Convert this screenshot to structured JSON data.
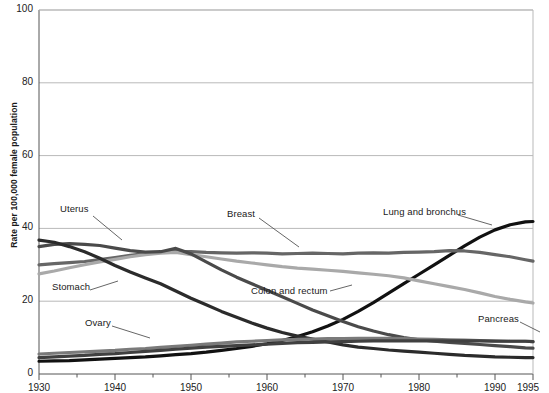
{
  "chart_data": {
    "type": "line",
    "title": "",
    "xlabel": "",
    "ylabel": "Rate per 100,000 female population",
    "xlim": [
      1930,
      1995
    ],
    "ylim": [
      0,
      100
    ],
    "grid": true,
    "legend_position": "inline-annotations",
    "x_ticks": [
      "1930",
      "1940",
      "1950",
      "1960",
      "1970",
      "1980",
      "1990",
      "1995"
    ],
    "x_tick_values": [
      1930,
      1940,
      1950,
      1960,
      1970,
      1980,
      1990,
      1995
    ],
    "x_minor_ticks": [
      1935,
      1945,
      1955,
      1965,
      1975,
      1985
    ],
    "y_ticks": [
      "0",
      "20",
      "40",
      "60",
      "80",
      "100"
    ],
    "y_tick_values": [
      0,
      20,
      40,
      60,
      80,
      100
    ],
    "x": [
      1930,
      1932,
      1934,
      1936,
      1938,
      1940,
      1942,
      1944,
      1946,
      1948,
      1950,
      1952,
      1954,
      1956,
      1958,
      1960,
      1962,
      1964,
      1966,
      1968,
      1970,
      1972,
      1974,
      1976,
      1978,
      1980,
      1982,
      1984,
      1986,
      1988,
      1990,
      1992,
      1994,
      1995
    ],
    "series": [
      {
        "name": "Lung and bronchus",
        "color": "#111111",
        "label_x": 383,
        "label_y": 213,
        "values": [
          3.5,
          3.6,
          3.7,
          3.9,
          4.1,
          4.3,
          4.5,
          4.7,
          5.0,
          5.3,
          5.6,
          6.0,
          6.5,
          7.0,
          7.6,
          8.3,
          9.2,
          10.3,
          11.6,
          13.2,
          15.0,
          17.2,
          19.6,
          22.2,
          24.8,
          27.4,
          30.0,
          32.6,
          35.2,
          37.6,
          39.6,
          41.0,
          41.8,
          41.9
        ]
      },
      {
        "name": "Breast",
        "color": "#666666",
        "label_x": 227,
        "label_y": 215,
        "values": [
          30.0,
          30.3,
          30.6,
          30.9,
          31.4,
          32.0,
          32.6,
          33.1,
          33.4,
          33.6,
          33.6,
          33.4,
          33.3,
          33.2,
          33.3,
          33.2,
          33.0,
          33.1,
          33.2,
          33.1,
          33.0,
          33.2,
          33.3,
          33.2,
          33.4,
          33.5,
          33.6,
          33.9,
          33.8,
          33.4,
          32.8,
          32.2,
          31.4,
          31.0
        ]
      },
      {
        "name": "Colon and rectum",
        "color": "#a9a9a9",
        "label_x": 251,
        "label_y": 292,
        "values": [
          27.5,
          28.3,
          29.2,
          30.0,
          30.8,
          31.5,
          32.2,
          32.8,
          33.2,
          33.4,
          32.8,
          32.2,
          31.6,
          31.0,
          30.5,
          30.0,
          29.5,
          29.1,
          28.8,
          28.5,
          28.2,
          27.8,
          27.4,
          27.0,
          26.4,
          25.6,
          24.8,
          24.0,
          23.2,
          22.3,
          21.3,
          20.5,
          19.8,
          19.5
        ]
      },
      {
        "name": "Uterus",
        "color": "#4a4a4a",
        "label_x": 60,
        "label_y": 210,
        "values": [
          35.0,
          35.6,
          35.8,
          35.6,
          35.3,
          34.6,
          33.9,
          33.5,
          33.6,
          34.5,
          33.0,
          30.8,
          28.6,
          26.6,
          24.8,
          23.0,
          21.2,
          19.4,
          17.6,
          16.0,
          14.4,
          13.0,
          11.8,
          10.8,
          10.0,
          9.4,
          9.0,
          8.7,
          8.4,
          8.1,
          7.8,
          7.5,
          7.2,
          7.1
        ]
      },
      {
        "name": "Stomach",
        "color": "#2b2b2b",
        "label_x": 52,
        "label_y": 288,
        "values": [
          36.8,
          36.2,
          35.0,
          33.6,
          31.8,
          29.8,
          28.0,
          26.4,
          24.8,
          22.8,
          20.8,
          19.0,
          17.2,
          15.6,
          14.0,
          12.6,
          11.4,
          10.4,
          9.6,
          8.8,
          8.0,
          7.4,
          7.0,
          6.6,
          6.3,
          6.0,
          5.7,
          5.4,
          5.1,
          4.9,
          4.7,
          4.6,
          4.5,
          4.5
        ]
      },
      {
        "name": "Ovary",
        "color": "#7a7a7a",
        "label_x": 85,
        "label_y": 324,
        "values": [
          5.5,
          5.7,
          5.9,
          6.1,
          6.3,
          6.5,
          6.8,
          7.0,
          7.3,
          7.6,
          7.9,
          8.2,
          8.5,
          8.8,
          9.0,
          9.2,
          9.4,
          9.5,
          9.6,
          9.7,
          9.7,
          9.8,
          9.8,
          9.8,
          9.7,
          9.6,
          9.5,
          9.4,
          9.3,
          9.2,
          9.1,
          9.0,
          9.0,
          8.9
        ]
      },
      {
        "name": "Pancreas",
        "color": "#404040",
        "label_x": 478,
        "label_y": 320,
        "values": [
          4.5,
          4.7,
          4.9,
          5.1,
          5.4,
          5.6,
          5.9,
          6.2,
          6.5,
          6.8,
          7.1,
          7.4,
          7.6,
          7.8,
          8.0,
          8.2,
          8.4,
          8.6,
          8.7,
          8.8,
          8.9,
          9.0,
          9.1,
          9.1,
          9.1,
          9.1,
          9.1,
          9.1,
          9.1,
          9.1,
          9.0,
          9.0,
          9.0,
          8.9
        ]
      }
    ],
    "annotations": [
      {
        "label": "Uterus",
        "leader_from": [
          93,
          216
        ],
        "leader_to": [
          122,
          240
        ]
      },
      {
        "label": "Stomach",
        "leader_from": [
          90,
          290
        ],
        "leader_to": [
          118,
          281
        ]
      },
      {
        "label": "Ovary",
        "leader_from": [
          112,
          326
        ],
        "leader_to": [
          150,
          338
        ]
      },
      {
        "label": "Breast",
        "leader_from": [
          259,
          218
        ],
        "leader_to": [
          299,
          247
        ]
      },
      {
        "label": "Colon and rectum",
        "leader_from": [
          330,
          291
        ],
        "leader_to": [
          352,
          285
        ]
      },
      {
        "label": "Lung and bronchus",
        "leader_from": [
          458,
          215
        ],
        "leader_to": [
          492,
          225
        ]
      },
      {
        "label": "Pancreas",
        "leader_from": [
          520,
          322
        ],
        "leader_to": [
          540,
          332
        ]
      }
    ]
  },
  "axes": {
    "plot_left": 39,
    "plot_right": 533,
    "plot_top": 10,
    "plot_bottom": 374,
    "grid_color": "#b9b9b9",
    "axis_color": "#555555"
  }
}
